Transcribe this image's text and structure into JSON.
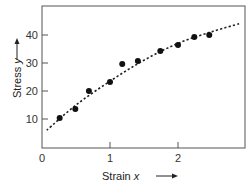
{
  "chart_data": {
    "type": "scatter",
    "title": "",
    "xlabel": "Strain x",
    "ylabel": "Stress y",
    "xlim": [
      0,
      3
    ],
    "ylim": [
      0,
      50
    ],
    "x_ticks": [
      0,
      1,
      2
    ],
    "y_ticks": [
      10,
      20,
      30,
      40
    ],
    "x_tick_labels": [
      "0",
      "1",
      "2"
    ],
    "y_tick_labels": [
      "10",
      "20",
      "30",
      "40"
    ],
    "grid": false,
    "legend": null,
    "series": [
      {
        "name": "measured data",
        "style": "filled-circle",
        "points": [
          {
            "x": 0.26,
            "y": 10.4
          },
          {
            "x": 0.49,
            "y": 13.6
          },
          {
            "x": 0.69,
            "y": 20.0
          },
          {
            "x": 1.0,
            "y": 23.2
          },
          {
            "x": 1.18,
            "y": 29.6
          },
          {
            "x": 1.41,
            "y": 30.7
          },
          {
            "x": 1.74,
            "y": 34.3
          },
          {
            "x": 2.0,
            "y": 36.4
          },
          {
            "x": 2.24,
            "y": 39.3
          },
          {
            "x": 2.46,
            "y": 40.0
          }
        ]
      },
      {
        "name": "fitted curve",
        "style": "dotted-line",
        "points": [
          {
            "x": 0.07,
            "y": 6.0
          },
          {
            "x": 0.5,
            "y": 15.0
          },
          {
            "x": 1.0,
            "y": 23.5
          },
          {
            "x": 1.5,
            "y": 31.0
          },
          {
            "x": 2.0,
            "y": 37.0
          },
          {
            "x": 2.5,
            "y": 41.2
          },
          {
            "x": 2.9,
            "y": 44.0
          }
        ]
      }
    ],
    "annotations": [
      "arrow next to y-axis label pointing up",
      "arrow next to x-axis label pointing right"
    ]
  },
  "labels": {
    "x_axis": "Strain ",
    "x_var": "x",
    "y_axis": "Stress ",
    "y_var": "y"
  }
}
